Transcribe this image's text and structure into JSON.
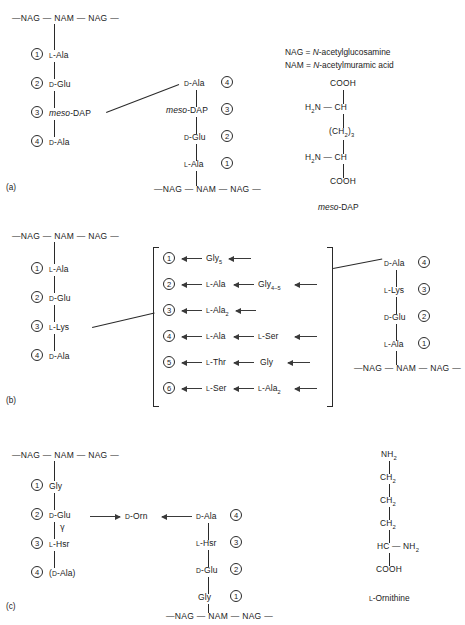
{
  "figure": {
    "panels": [
      "(a)",
      "(b)",
      "(c)"
    ],
    "backbone": {
      "nag": "NAG",
      "nam": "NAM",
      "dash": "—"
    },
    "legend": {
      "line1_key": "NAG = ",
      "line1_italic": "N",
      "line1_rest": "-acetylglucosamine",
      "line2_key": "NAM = ",
      "line2_italic": "N",
      "line2_rest": "-acetylmuramic acid"
    }
  },
  "panel_a": {
    "label": "(a)",
    "backbone_top": [
      "NAG",
      "NAM",
      "NAG"
    ],
    "backbone_bottom": [
      "NAG",
      "NAM",
      "NAG"
    ],
    "left_chain": [
      {
        "n": "1",
        "prefix": "L",
        "name": "-Ala"
      },
      {
        "n": "2",
        "prefix": "D",
        "name": "-Glu"
      },
      {
        "n": "3",
        "prefix": "",
        "italic": "meso",
        "name": "-DAP"
      },
      {
        "n": "4",
        "prefix": "D",
        "name": "-Ala"
      }
    ],
    "right_chain": [
      {
        "n": "4",
        "prefix": "D",
        "name": "-Ala"
      },
      {
        "n": "3",
        "prefix": "",
        "italic": "meso",
        "name": "-DAP"
      },
      {
        "n": "2",
        "prefix": "D",
        "name": "-Glu"
      },
      {
        "n": "1",
        "prefix": "L",
        "name": "-Ala"
      }
    ],
    "structure": {
      "caption_italic": "meso",
      "caption_rest": "-DAP",
      "atoms": [
        "COOH",
        "H2N — CH",
        "(CH2)3",
        "H2N — CH",
        "COOH"
      ]
    }
  },
  "panel_b": {
    "label": "(b)",
    "backbone_top": [
      "NAG",
      "NAM",
      "NAG"
    ],
    "backbone_bottom": [
      "NAG",
      "NAM",
      "NAG"
    ],
    "left_chain": [
      {
        "n": "1",
        "prefix": "L",
        "name": "-Ala"
      },
      {
        "n": "2",
        "prefix": "D",
        "name": "-Glu"
      },
      {
        "n": "3",
        "prefix": "L",
        "name": "-Lys"
      },
      {
        "n": "4",
        "prefix": "D",
        "name": "-Ala"
      }
    ],
    "bridges": [
      {
        "n": "1",
        "first_prefix": "",
        "first": "Gly",
        "first_sub": "5",
        "second_prefix": "",
        "second": "",
        "second_sub": ""
      },
      {
        "n": "2",
        "first_prefix": "L",
        "first": "-Ala",
        "first_sub": "",
        "second_prefix": "",
        "second": "Gly",
        "second_sub": "4–5"
      },
      {
        "n": "3",
        "first_prefix": "L",
        "first": "-Ala",
        "first_sub": "2",
        "second_prefix": "",
        "second": "",
        "second_sub": ""
      },
      {
        "n": "4",
        "first_prefix": "L",
        "first": "-Ala",
        "first_sub": "",
        "second_prefix": "L",
        "second": "-Ser",
        "second_sub": ""
      },
      {
        "n": "5",
        "first_prefix": "L",
        "first": "-Thr",
        "first_sub": "",
        "second_prefix": "",
        "second": "Gly",
        "second_sub": ""
      },
      {
        "n": "6",
        "first_prefix": "L",
        "first": "-Ser",
        "first_sub": "",
        "second_prefix": "L",
        "second": "-Ala",
        "second_sub": "2"
      }
    ],
    "right_chain": [
      {
        "n": "4",
        "prefix": "D",
        "name": "-Ala"
      },
      {
        "n": "3",
        "prefix": "L",
        "name": "-Lys"
      },
      {
        "n": "2",
        "prefix": "D",
        "name": "-Glu"
      },
      {
        "n": "1",
        "prefix": "L",
        "name": "-Ala"
      }
    ]
  },
  "panel_c": {
    "label": "(c)",
    "backbone_top": [
      "NAG",
      "NAM",
      "NAG"
    ],
    "backbone_bottom": [
      "NAG",
      "NAM",
      "NAG"
    ],
    "left_chain": [
      {
        "n": "1",
        "prefix": "",
        "name": "Gly"
      },
      {
        "n": "2",
        "prefix": "D",
        "name": "-Glu"
      },
      {
        "n": "3",
        "prefix": "L",
        "name": "-Hsr"
      },
      {
        "n": "4",
        "prefix": "D",
        "name": "(D-Ala)"
      }
    ],
    "gamma": "γ",
    "bridge": {
      "prefix": "D",
      "name": "-Orn"
    },
    "right_chain": [
      {
        "n": "4",
        "prefix": "D",
        "name": "-Ala"
      },
      {
        "n": "3",
        "prefix": "L",
        "name": "-Hsr"
      },
      {
        "n": "2",
        "prefix": "D",
        "name": "-Glu"
      },
      {
        "n": "1",
        "prefix": "",
        "name": "Gly"
      }
    ],
    "structure": {
      "caption_prefix": "L",
      "caption_rest": "-Ornithine",
      "atoms": [
        "NH2",
        "CH2",
        "CH2",
        "CH2",
        "HC — NH2",
        "COOH"
      ]
    }
  }
}
